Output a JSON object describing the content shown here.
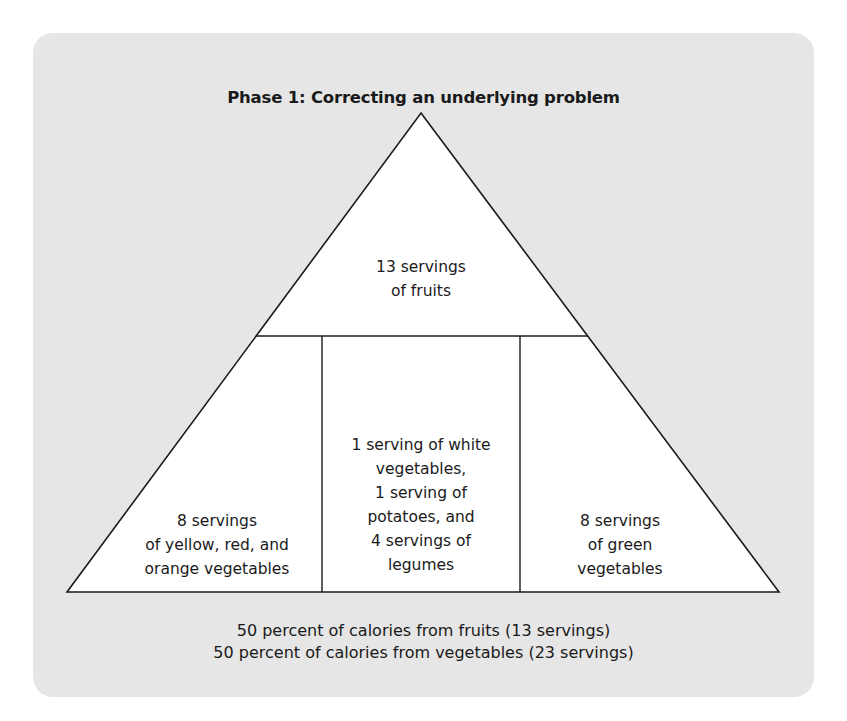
{
  "diagram": {
    "type": "food-pyramid",
    "title": "Phase 1: Correcting an underlying problem",
    "top_tier": {
      "label_line1": "13 servings",
      "label_line2": "of fruits"
    },
    "bottom_tier": {
      "left": {
        "line1": "8 servings",
        "line2": "of yellow, red, and",
        "line3": "orange vegetables"
      },
      "center": {
        "line1": "1 serving of white",
        "line2": "vegetables,",
        "line3": "1 serving of",
        "line4": "potatoes, and",
        "line5": "4 servings of",
        "line6": "legumes"
      },
      "right": {
        "line1": "8 servings",
        "line2": "of green",
        "line3": "vegetables"
      }
    },
    "footer": {
      "line1": "50 percent of calories from fruits (13 servings)",
      "line2": "50 percent of calories from vegetables (23 servings)"
    },
    "colors": {
      "panel_background": "#e6e6e6",
      "pyramid_fill": "#ffffff",
      "stroke": "#1a1a1a"
    }
  }
}
